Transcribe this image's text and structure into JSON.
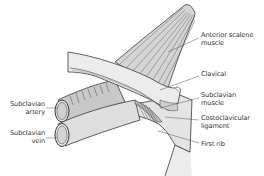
{
  "diagram": {
    "type": "anatomical-illustration",
    "colors": {
      "background": "#ffffff",
      "outline": "#3a3a3a",
      "fill_light": "#ececec",
      "fill_mid": "#d6d6d6",
      "fill_dark": "#b8b8b8",
      "leader_line": "#555555",
      "label_text": "#333333"
    },
    "labels": {
      "anterior_scalene": {
        "line1": "Anterior scalene",
        "line2": "muscle"
      },
      "clavical": {
        "line1": "Clavical"
      },
      "subclavian_muscle": {
        "line1": "Subclavian",
        "line2": "muscle"
      },
      "costoclavicular": {
        "line1": "Costoclavicular",
        "line2": "ligament"
      },
      "first_rib": {
        "line1": "First rib"
      },
      "subclavian_artery": {
        "line1": "Subclavian",
        "line2": "artery"
      },
      "subclavian_vein": {
        "line1": "Subclavian",
        "line2": "vein"
      }
    }
  }
}
